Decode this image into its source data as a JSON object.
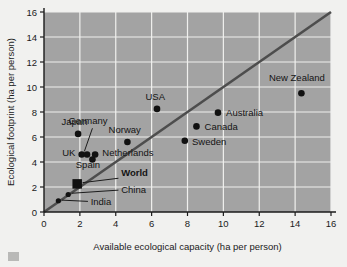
{
  "figure": {
    "background_color": "#f1f1ef",
    "plot_background_color": "#a3a3a3",
    "gridline_color": "#f0f0ee",
    "axis_color": "#1b1b1b",
    "marker_color": "#111111",
    "diagonal_line_color": "#4d4d4d"
  },
  "chart_data": {
    "type": "scatter",
    "title": "",
    "xlabel": "Available ecological capacity (ha per person)",
    "ylabel": "Ecological footprint (ha per person)",
    "xlim": [
      0,
      16
    ],
    "ylim": [
      0,
      16
    ],
    "xticks": [
      0,
      2,
      4,
      6,
      8,
      10,
      12,
      14,
      16
    ],
    "yticks": [
      0,
      2,
      4,
      6,
      8,
      10,
      12,
      14,
      16
    ],
    "xticklabels": [
      "0",
      "2",
      "4",
      "6",
      "8",
      "10",
      "12",
      "14",
      "16"
    ],
    "yticklabels": [
      "0",
      "2",
      "4",
      "6",
      "8",
      "10",
      "12",
      "14",
      "16"
    ],
    "grid": true,
    "legend": "none",
    "reference_line": {
      "name": "equality-line",
      "type": "identity",
      "from": [
        0,
        0
      ],
      "to": [
        16.4,
        16.4
      ],
      "description": "footprint equals capacity"
    },
    "points": [
      {
        "name": "India",
        "x": 0.8,
        "y": 0.9,
        "marker": "circle",
        "size": "small",
        "label": "India",
        "label_x": 2.6,
        "label_y": 0.55,
        "label_anchor": "start",
        "leader": {
          "from": [
            2.45,
            0.85
          ],
          "to": [
            1.0,
            0.95
          ]
        }
      },
      {
        "name": "China",
        "x": 1.35,
        "y": 1.4,
        "marker": "circle",
        "size": "small",
        "label": "China",
        "label_x": 4.3,
        "label_y": 1.55,
        "label_anchor": "start",
        "leader": {
          "from": [
            4.15,
            1.75
          ],
          "to": [
            1.55,
            1.5
          ]
        }
      },
      {
        "name": "World",
        "x": 1.85,
        "y": 2.25,
        "marker": "square",
        "size": "large",
        "label": "World",
        "label_x": 4.3,
        "label_y": 2.85,
        "label_anchor": "start",
        "bold": true,
        "leader": {
          "from": [
            4.15,
            2.7
          ],
          "to": [
            2.15,
            2.35
          ]
        }
      },
      {
        "name": "Spain",
        "x": 2.7,
        "y": 4.2,
        "marker": "circle",
        "size": "medium",
        "label": "Spain",
        "label_x": 2.45,
        "label_y": 3.55,
        "label_anchor": "middle"
      },
      {
        "name": "UK",
        "x": 2.1,
        "y": 4.6,
        "marker": "circle",
        "size": "medium",
        "label": "UK",
        "label_x": 1.75,
        "label_y": 4.45,
        "label_anchor": "end"
      },
      {
        "name": "Germany",
        "x": 2.4,
        "y": 4.6,
        "marker": "circle",
        "size": "medium",
        "label": "Germany",
        "label_x": 2.45,
        "label_y": 7.05,
        "label_anchor": "middle",
        "leader": {
          "from": [
            2.7,
            6.7
          ],
          "to": [
            2.25,
            4.85
          ]
        }
      },
      {
        "name": "Netherlands",
        "x": 2.85,
        "y": 4.6,
        "marker": "circle",
        "size": "medium",
        "label": "Netherlands",
        "label_x": 3.25,
        "label_y": 4.45,
        "label_anchor": "start"
      },
      {
        "name": "Japan",
        "x": 1.9,
        "y": 6.25,
        "marker": "circle",
        "size": "medium",
        "label": "Japan",
        "label_x": 1.7,
        "label_y": 6.95,
        "label_anchor": "middle"
      },
      {
        "name": "Norway",
        "x": 4.65,
        "y": 5.6,
        "marker": "circle",
        "size": "medium",
        "label": "Norway",
        "label_x": 4.5,
        "label_y": 6.3,
        "label_anchor": "middle"
      },
      {
        "name": "USA",
        "x": 6.3,
        "y": 8.25,
        "marker": "circle",
        "size": "medium",
        "label": "USA",
        "label_x": 6.2,
        "label_y": 8.95,
        "label_anchor": "middle"
      },
      {
        "name": "Sweden",
        "x": 7.85,
        "y": 5.7,
        "marker": "circle",
        "size": "medium",
        "label": "Sweden",
        "label_x": 8.25,
        "label_y": 5.35,
        "label_anchor": "start"
      },
      {
        "name": "Canada",
        "x": 8.5,
        "y": 6.85,
        "marker": "circle",
        "size": "medium",
        "label": "Canada",
        "label_x": 8.95,
        "label_y": 6.55,
        "label_anchor": "start"
      },
      {
        "name": "Australia",
        "x": 9.7,
        "y": 7.95,
        "marker": "circle",
        "size": "medium",
        "label": "Australia",
        "label_x": 10.15,
        "label_y": 7.65,
        "label_anchor": "start"
      },
      {
        "name": "New Zealand",
        "x": 14.35,
        "y": 9.5,
        "marker": "circle",
        "size": "medium",
        "label": "New Zealand",
        "label_x": 14.1,
        "label_y": 10.5,
        "label_anchor": "middle"
      }
    ]
  }
}
